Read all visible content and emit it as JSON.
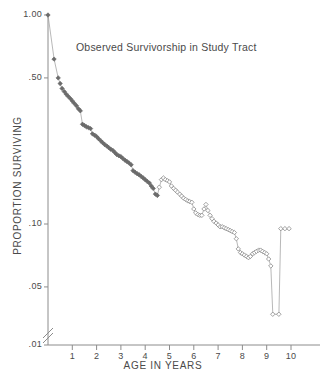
{
  "chart_data": {
    "type": "scatter",
    "title": "Observed Survivorship in Study Tract",
    "xlabel": "AGE IN YEARS",
    "ylabel": "PROPORTION SURVIVING",
    "yscale": "log",
    "ylim": [
      0.01,
      1.0
    ],
    "xlim": [
      0,
      10.6
    ],
    "grid": false,
    "legend": null,
    "axis_break": "y-axis broken between 0.05 and 0.01",
    "ytick_labels": [
      "1.00",
      ".50",
      ".10",
      ".05",
      ".01"
    ],
    "ytick_values": [
      1.0,
      0.5,
      0.1,
      0.05,
      0.01
    ],
    "xtick_labels": [
      "1",
      "2",
      "3",
      "4",
      "5",
      "6",
      "7",
      "8",
      "9",
      "10"
    ],
    "xtick_values": [
      1,
      2,
      3,
      4,
      5,
      6,
      7,
      8,
      9,
      10
    ],
    "series": [
      {
        "name": "observed survivorship (filled markers)",
        "marker": "filled-diamond",
        "marker_fill": "#6b6b6b",
        "line_color": "#8a8a8a",
        "x": [
          0.0,
          0.25,
          0.42,
          0.5,
          0.58,
          0.67,
          0.75,
          0.83,
          0.92,
          1.0,
          1.08,
          1.17,
          1.25,
          1.33,
          1.42,
          1.5,
          1.58,
          1.67,
          1.75,
          1.83,
          1.92,
          2.0,
          2.08,
          2.17,
          2.25,
          2.33,
          2.42,
          2.5,
          2.58,
          2.67,
          2.75,
          2.83,
          2.92,
          3.0,
          3.08,
          3.17,
          3.25,
          3.33,
          3.42,
          3.5,
          3.58,
          3.67,
          3.75,
          3.83,
          3.92,
          4.0,
          4.08,
          4.17,
          4.25,
          4.33,
          4.42,
          4.5
        ],
        "y": [
          1.0,
          0.615,
          0.5,
          0.47,
          0.445,
          0.43,
          0.418,
          0.408,
          0.398,
          0.388,
          0.378,
          0.368,
          0.356,
          0.348,
          0.3,
          0.296,
          0.292,
          0.289,
          0.286,
          0.27,
          0.266,
          0.262,
          0.256,
          0.25,
          0.245,
          0.24,
          0.236,
          0.232,
          0.228,
          0.225,
          0.22,
          0.215,
          0.212,
          0.21,
          0.206,
          0.202,
          0.199,
          0.196,
          0.192,
          0.18,
          0.177,
          0.174,
          0.172,
          0.169,
          0.166,
          0.163,
          0.16,
          0.157,
          0.152,
          0.148,
          0.139,
          0.137
        ]
      },
      {
        "name": "observed survivorship (open markers)",
        "marker": "open-diamond",
        "marker_fill": "#ffffff",
        "line_color": "#9a9a9a",
        "x": [
          4.58,
          4.67,
          4.75,
          4.83,
          4.92,
          5.0,
          5.08,
          5.17,
          5.25,
          5.33,
          5.42,
          5.5,
          5.58,
          5.67,
          5.75,
          5.83,
          5.92,
          6.0,
          6.08,
          6.17,
          6.25,
          6.33,
          6.42,
          6.5,
          6.58,
          6.67,
          6.75,
          6.83,
          6.92,
          7.0,
          7.08,
          7.17,
          7.25,
          7.33,
          7.42,
          7.5,
          7.58,
          7.67,
          7.75,
          7.83,
          7.92,
          8.0,
          8.08,
          8.17,
          8.25,
          8.33,
          8.42,
          8.5,
          8.58,
          8.67,
          8.75,
          8.83,
          8.92,
          9.0,
          9.08,
          9.17,
          9.25,
          9.5,
          9.58,
          9.75,
          9.92
        ],
        "y": [
          0.15,
          0.163,
          0.166,
          0.163,
          0.161,
          0.159,
          0.152,
          0.148,
          0.145,
          0.142,
          0.139,
          0.136,
          0.133,
          0.131,
          0.129,
          0.128,
          0.127,
          0.118,
          0.113,
          0.111,
          0.11,
          0.11,
          0.118,
          0.124,
          0.116,
          0.11,
          0.106,
          0.103,
          0.101,
          0.099,
          0.097,
          0.097,
          0.096,
          0.095,
          0.094,
          0.093,
          0.092,
          0.091,
          0.085,
          0.076,
          0.073,
          0.072,
          0.071,
          0.07,
          0.069,
          0.07,
          0.072,
          0.073,
          0.074,
          0.075,
          0.075,
          0.074,
          0.073,
          0.072,
          0.068,
          0.063,
          0.037,
          0.037,
          0.095,
          0.095,
          0.095
        ]
      }
    ]
  },
  "axes": {
    "ytick_labels": [
      "1.00",
      ".50",
      ".10",
      ".05",
      ".01"
    ],
    "xtick_labels": [
      "1",
      "2",
      "3",
      "4",
      "5",
      "6",
      "7",
      "8",
      "9",
      "10"
    ]
  },
  "labels": {
    "title": "Observed Survivorship in Study Tract",
    "xlabel": "AGE IN YEARS",
    "ylabel": "PROPORTION SURVIVING"
  }
}
